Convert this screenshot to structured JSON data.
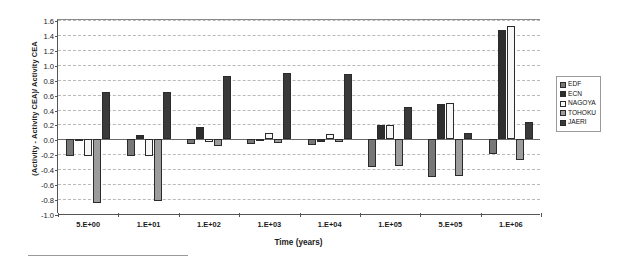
{
  "chart_data": {
    "type": "bar",
    "title": "",
    "xlabel": "Time (years)",
    "ylabel": "(Activity - Activity CEA)/ Activity CEA",
    "categories": [
      "5.E+00",
      "1.E+01",
      "1.E+02",
      "1.E+03",
      "1.E+04",
      "1.E+05",
      "5.E+05",
      "1.E+06"
    ],
    "ylim": [
      -1.0,
      1.6
    ],
    "ytick_labels": [
      "1.6",
      "1.4",
      "1.2",
      "1.0",
      "0.8",
      "0.6",
      "0.4",
      "0.2",
      "0.0",
      "-0.2",
      "-0.4",
      "-0.6",
      "-0.8",
      "-1.0"
    ],
    "ytick_values": [
      1.6,
      1.4,
      1.2,
      1.0,
      0.8,
      0.6,
      0.4,
      0.2,
      0.0,
      -0.2,
      -0.4,
      -0.6,
      -0.8,
      -1.0
    ],
    "grid": true,
    "legend_position": "right",
    "series": [
      {
        "name": "EDF",
        "color": "#777777",
        "values": [
          -0.22,
          -0.22,
          -0.06,
          -0.06,
          -0.08,
          -0.37,
          -0.5,
          -0.2
        ]
      },
      {
        "name": "ECN",
        "color": "#2e2e2e",
        "values": [
          0.0,
          0.06,
          0.16,
          0.0,
          -0.03,
          0.19,
          0.47,
          1.46
        ]
      },
      {
        "name": "NAGOYA",
        "color": "#f7f7f7",
        "values": [
          -0.22,
          -0.22,
          -0.04,
          0.09,
          0.07,
          0.19,
          0.49,
          1.52
        ]
      },
      {
        "name": "TOHOKU",
        "color": "#9c9c9c",
        "values": [
          -0.85,
          -0.82,
          -0.09,
          -0.05,
          -0.04,
          -0.36,
          -0.49,
          -0.27
        ]
      },
      {
        "name": "JAERI",
        "color": "#3a3a3a",
        "values": [
          0.64,
          0.63,
          0.85,
          0.89,
          0.88,
          0.43,
          0.09,
          0.23
        ]
      }
    ]
  },
  "legend": {
    "items": [
      {
        "label": "EDF"
      },
      {
        "label": "ECN"
      },
      {
        "label": "NAGOYA"
      },
      {
        "label": "TOHOKU"
      },
      {
        "label": "JAERI"
      }
    ]
  }
}
